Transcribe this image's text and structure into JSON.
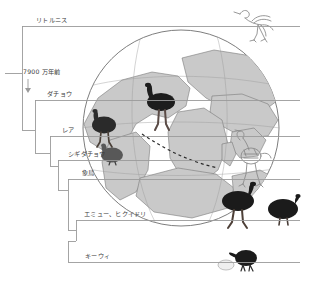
{
  "figure": {
    "type": "cladogram-with-paleomap",
    "background_color": "#ffffff",
    "line_color": "#8a8a8a",
    "text_color": "#3c3c3c"
  },
  "tree": {
    "taxa": [
      {
        "id": "lithornis",
        "label": "リトルニス",
        "tip_y": 26,
        "branch_x": 22
      },
      {
        "id": "ostrich",
        "label": "ダチョウ",
        "tip_y": 100,
        "branch_x": 35
      },
      {
        "id": "rhea",
        "label": "レア",
        "tip_y": 136,
        "branch_x": 50
      },
      {
        "id": "tinamou",
        "label": "シギダチョウ",
        "tip_y": 160,
        "branch_x": 58
      },
      {
        "id": "elephantbird",
        "label": "象鳥",
        "tip_y": 179,
        "branch_x": 68
      },
      {
        "id": "emu_cassowary",
        "label": "エミュー、ヒクイドリ",
        "tip_y": 220,
        "branch_x": 76
      },
      {
        "id": "kiwi",
        "label": "キーウィ",
        "tip_y": 262,
        "branch_x": 68
      }
    ],
    "annotations": [
      {
        "id": "divergence-age",
        "label": "7900 万年前",
        "marker": "down-arrow",
        "x": 28,
        "y": 72
      }
    ],
    "root": {
      "x": 5,
      "y": 73
    }
  },
  "globe": {
    "center_x": 181,
    "center_y": 128,
    "radius": 99,
    "land_color": "#c9c9c9",
    "outline_color": "#6f6f6f"
  },
  "illustrations": [
    {
      "id": "lithornis-skeleton-bird",
      "name": "lithornis-bird-illustration",
      "x": 232,
      "y": 8,
      "style": "line-drawing"
    },
    {
      "id": "ostrich-bird",
      "name": "ostrich-illustration",
      "x": 144,
      "y": 84,
      "style": "dark-silhouette"
    },
    {
      "id": "rhea-bird",
      "name": "rhea-illustration",
      "x": 89,
      "y": 110,
      "style": "dark-silhouette"
    },
    {
      "id": "tinamou-bird",
      "name": "tinamou-illustration",
      "x": 99,
      "y": 145,
      "style": "grey-silhouette"
    },
    {
      "id": "elephantbird-skeleton",
      "name": "elephant-bird-skeleton",
      "x": 228,
      "y": 133,
      "style": "skeleton-drawing"
    },
    {
      "id": "emu-bird",
      "name": "emu-illustration",
      "x": 218,
      "y": 184,
      "style": "dark-silhouette"
    },
    {
      "id": "cassowary-bird",
      "name": "cassowary-illustration",
      "x": 265,
      "y": 195,
      "style": "dark-silhouette"
    },
    {
      "id": "kiwi-bird",
      "name": "kiwi-illustration",
      "x": 233,
      "y": 250,
      "style": "dark-silhouette"
    },
    {
      "id": "kiwi-egg",
      "name": "kiwi-egg-illustration",
      "x": 221,
      "y": 262,
      "style": "white-oval"
    }
  ]
}
